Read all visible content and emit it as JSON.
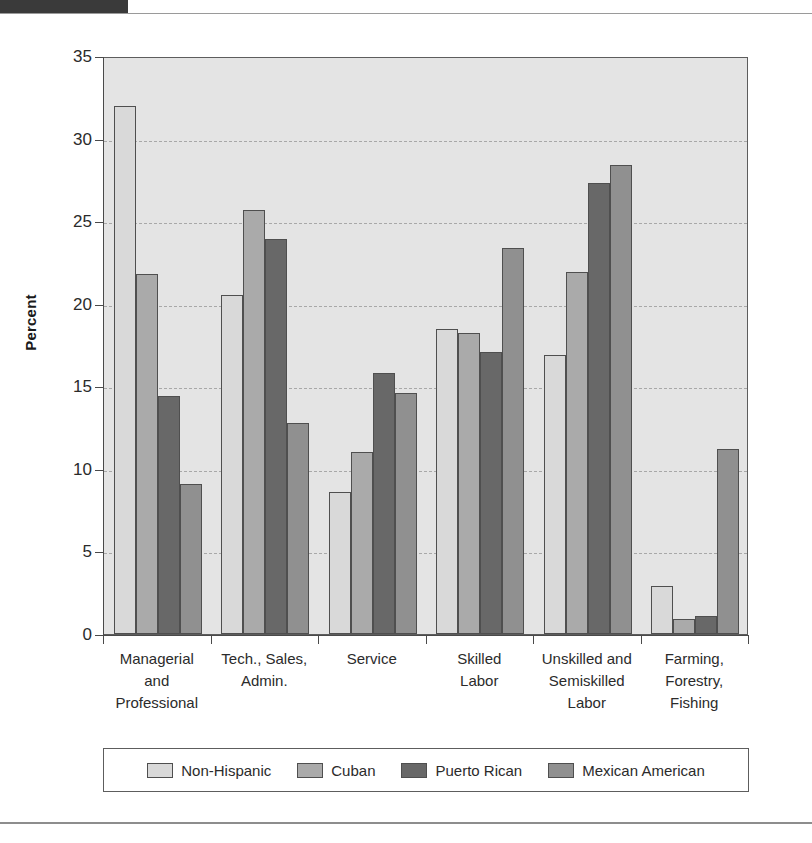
{
  "header": {
    "tab_label": "",
    "caption": "",
    "rule_color": "#9a9a9a"
  },
  "chart_data": {
    "type": "bar",
    "title": "",
    "xlabel": "",
    "ylabel": "Percent",
    "ylim": [
      0,
      35
    ],
    "ytick_step": 5,
    "yticks": [
      "35",
      "30",
      "25",
      "20",
      "15",
      "10",
      "5",
      "0"
    ],
    "grid": "horizontal-dashed",
    "legend_position": "bottom",
    "categories": [
      "Managerial\nand\nProfessional",
      "Tech., Sales,\nAdmin.",
      "Service",
      "Skilled\nLabor",
      "Unskilled and\nSemiskilled\nLabor",
      "Farming,\nForestry,\nFishing"
    ],
    "series": [
      {
        "name": "Non-Hispanic",
        "color": "#d9d9d9",
        "values": [
          32.0,
          20.5,
          8.6,
          18.5,
          16.9,
          2.9
        ]
      },
      {
        "name": "Cuban",
        "color": "#aaaaaa",
        "values": [
          21.8,
          25.7,
          11.0,
          18.2,
          21.9,
          0.9
        ]
      },
      {
        "name": "Puerto Rican",
        "color": "#686868",
        "values": [
          14.4,
          23.9,
          15.8,
          17.1,
          27.3,
          1.1
        ]
      },
      {
        "name": "Mexican American",
        "color": "#909090",
        "values": [
          9.1,
          12.8,
          14.6,
          23.4,
          28.4,
          11.2
        ]
      }
    ],
    "plot_background": "#e4e4e4",
    "axis_color": "#4a4a4a",
    "gridline_color": "#a8a8a8"
  }
}
